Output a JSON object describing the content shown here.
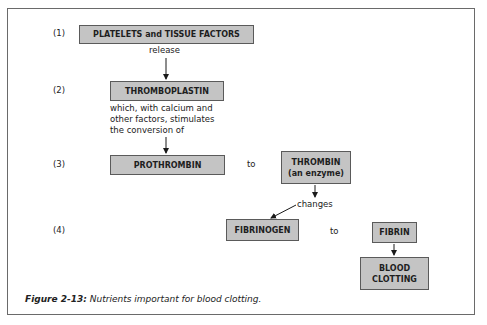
{
  "steps": [
    "(1)",
    "(2)",
    "(3)",
    "(4)"
  ],
  "boxes": {
    "platelets": "PLATELETS and TISSUE FACTORS",
    "thromboplastin": "THROMBOPLASTIN",
    "prothrombin": "PROTHROMBIN",
    "thrombin_line1": "THROMBIN",
    "thrombin_line2": "(an enzyme)",
    "fibrinogen": "FIBRINOGEN",
    "fibrin": "FIBRIN",
    "blood_clotting_line1": "BLOOD",
    "blood_clotting_line2": "CLOTTING"
  },
  "labels": {
    "release": "release",
    "stimulates_line1": "which, with calcium and",
    "stimulates_line2": "other factors, stimulates",
    "stimulates_line3": "the conversion of",
    "to_1": "to",
    "changes": "changes",
    "to_2": "to"
  },
  "caption": {
    "figure_label": "Figure 2-13:",
    "text": " Nutrients important for blood clotting."
  }
}
